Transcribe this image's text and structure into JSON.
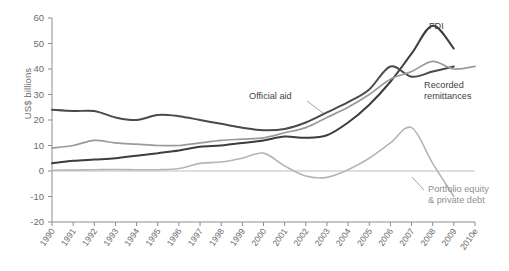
{
  "chart_data": {
    "type": "line",
    "title": "",
    "xlabel": "",
    "ylabel": "US$ billions",
    "ylim": [
      -20,
      60
    ],
    "yticks": [
      -20,
      -10,
      0,
      10,
      20,
      30,
      40,
      50,
      60
    ],
    "grid": false,
    "legend_position": "inline-annotations",
    "categories": [
      "1990",
      "1991",
      "1992",
      "1993",
      "1994",
      "1995",
      "1996",
      "1997",
      "1998",
      "1999",
      "2000",
      "2001",
      "2002",
      "2003",
      "2004",
      "2005",
      "2006",
      "2007",
      "2008",
      "2009",
      "2010e"
    ],
    "series": [
      {
        "name": "FDI",
        "color": "#3d3d3d",
        "label_text": "FDI",
        "values": [
          3,
          4,
          4.5,
          5,
          6,
          7,
          8,
          9.5,
          10,
          11,
          12,
          13.5,
          13,
          14,
          19,
          26,
          35,
          46,
          57,
          48,
          null
        ]
      },
      {
        "name": "Official aid",
        "color": "#4a4a4a",
        "label_text": "Official aid",
        "values": [
          24,
          23.5,
          23.5,
          21,
          20,
          22,
          21.5,
          20,
          18.5,
          17,
          16,
          16.5,
          19,
          23,
          27,
          32,
          41,
          37,
          39,
          41,
          null
        ]
      },
      {
        "name": "Recorded remittances",
        "color": "#9a9a9a",
        "label_text": "Recorded remittances",
        "values": [
          9,
          10,
          12,
          11,
          10.5,
          10,
          10,
          11,
          12,
          12.5,
          13,
          15,
          17,
          21,
          25,
          30,
          36,
          39,
          43,
          40,
          41
        ]
      },
      {
        "name": "Portfolio equity & private debt",
        "color": "#b5b5b5",
        "label_text": "Portfolio equity\n& private debt",
        "values": [
          0.3,
          0.4,
          0.5,
          0.6,
          0.5,
          0.5,
          1,
          3,
          3.5,
          5,
          7,
          2,
          -2,
          -2.5,
          0.5,
          5,
          11,
          17,
          3,
          -10,
          null
        ]
      }
    ],
    "annotations": [
      {
        "id": "fdi",
        "text": "FDI"
      },
      {
        "id": "official-aid",
        "text": "Official aid"
      },
      {
        "id": "recorded-remittances",
        "text": "Recorded\nremittances"
      },
      {
        "id": "portfolio",
        "text": "Portfolio equity\n& private debt"
      }
    ]
  },
  "axis": {
    "y_label": "US$ billions",
    "y_ticks": [
      "60",
      "50",
      "40",
      "30",
      "20",
      "10",
      "0",
      "-10",
      "-20"
    ],
    "x_ticks": [
      "1990",
      "1991",
      "1992",
      "1993",
      "1994",
      "1995",
      "1996",
      "1997",
      "1998",
      "1999",
      "2000",
      "2001",
      "2002",
      "2003",
      "2004",
      "2005",
      "2006",
      "2007",
      "2008",
      "2009",
      "2010e"
    ]
  },
  "labels": {
    "fdi": "FDI",
    "official_aid": "Official aid",
    "remittances_line1": "Recorded",
    "remittances_line2": "remittances",
    "portfolio_line1": "Portfolio equity",
    "portfolio_line2": "& private debt"
  },
  "colors": {
    "fdi": "#3d3d3d",
    "official_aid": "#4a4a4a",
    "remittances": "#9a9a9a",
    "portfolio": "#b5b5b5",
    "axis": "#8d8d8d",
    "text": "#6b6b6b"
  }
}
